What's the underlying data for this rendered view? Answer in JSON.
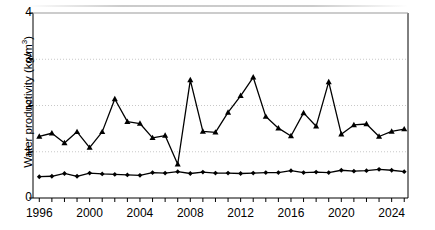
{
  "chart_data": {
    "type": "line",
    "title": "",
    "subtitle": "",
    "xlabel": "",
    "ylabel": "Water productivity (kg/m",
    "ylabel_superscript": "3",
    "ylabel_suffix": ")",
    "ylabel_full": "Water productivity (kg/m³)",
    "xlim": [
      1995.5,
      2025.3
    ],
    "ylim": [
      0,
      4
    ],
    "yticks": [
      0,
      1,
      2,
      3,
      4
    ],
    "ytick_labels": [
      "0",
      "1",
      "2",
      "3",
      "4"
    ],
    "xticks": [
      1996,
      1997,
      1998,
      1999,
      2000,
      2001,
      2002,
      2003,
      2004,
      2005,
      2006,
      2007,
      2008,
      2009,
      2010,
      2011,
      2012,
      2013,
      2014,
      2015,
      2016,
      2017,
      2018,
      2019,
      2020,
      2021,
      2022,
      2023,
      2024,
      2025
    ],
    "xtick_labels_shown": [
      "1996",
      "2000",
      "2004",
      "2008",
      "2012",
      "2016",
      "2020",
      "2024"
    ],
    "xtick_labels_shown_values": [
      1996,
      2000,
      2004,
      2008,
      2012,
      2016,
      2020,
      2024
    ],
    "grid": true,
    "grid_axis": "y",
    "grid_style": "dotted",
    "grid_color": "#c8c8c8",
    "legend": false,
    "legend_position": "none",
    "frame_color": "#000000",
    "series": [
      {
        "name": "upper-series",
        "marker": "triangle",
        "color": "#000000",
        "x": [
          1996,
          1997,
          1998,
          1999,
          2000,
          2001,
          2002,
          2003,
          2004,
          2005,
          2006,
          2007,
          2008,
          2009,
          2010,
          2011,
          2012,
          2013,
          2014,
          2015,
          2016,
          2017,
          2018,
          2019,
          2020,
          2021,
          2022,
          2023,
          2024,
          2025
        ],
        "values": [
          1.33,
          1.4,
          1.19,
          1.43,
          1.09,
          1.43,
          2.14,
          1.65,
          1.61,
          1.3,
          1.35,
          0.73,
          2.55,
          1.44,
          1.42,
          1.85,
          2.21,
          2.61,
          1.76,
          1.51,
          1.34,
          1.84,
          1.55,
          2.51,
          1.38,
          1.58,
          1.6,
          1.33,
          1.44,
          1.49
        ]
      },
      {
        "name": "lower-series",
        "marker": "diamond",
        "color": "#000000",
        "x": [
          1996,
          1997,
          1998,
          1999,
          2000,
          2001,
          2002,
          2003,
          2004,
          2005,
          2006,
          2007,
          2008,
          2009,
          2010,
          2011,
          2012,
          2013,
          2014,
          2015,
          2016,
          2017,
          2018,
          2019,
          2020,
          2021,
          2022,
          2023,
          2024,
          2025
        ],
        "values": [
          0.46,
          0.47,
          0.53,
          0.47,
          0.54,
          0.52,
          0.51,
          0.5,
          0.49,
          0.55,
          0.54,
          0.57,
          0.53,
          0.56,
          0.54,
          0.54,
          0.53,
          0.54,
          0.55,
          0.55,
          0.59,
          0.55,
          0.56,
          0.55,
          0.6,
          0.58,
          0.59,
          0.62,
          0.6,
          0.57
        ]
      }
    ]
  }
}
